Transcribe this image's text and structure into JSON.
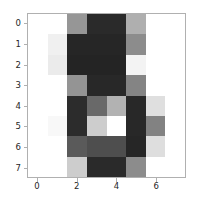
{
  "chart_data": {
    "type": "heatmap",
    "title": "",
    "xlabel": "",
    "ylabel": "",
    "colormap": "gray",
    "grid": false,
    "legend": false,
    "colorbar": false,
    "nrows": 8,
    "ncols": 8,
    "xlim": [
      -0.5,
      7.5
    ],
    "ylim": [
      7.5,
      -0.5
    ],
    "xticks": [
      0,
      2,
      4,
      6
    ],
    "yticks": [
      0,
      1,
      2,
      3,
      4,
      5,
      6,
      7
    ],
    "xtick_labels": [
      "0",
      "2",
      "4",
      "6"
    ],
    "ytick_labels": [
      "0",
      "1",
      "2",
      "3",
      "4",
      "5",
      "6",
      "7"
    ],
    "value_range": [
      0,
      255
    ],
    "note": "Grayscale intensity values; 0 = black, 255 = white",
    "values": [
      [
        255,
        255,
        150,
        42,
        42,
        175,
        255,
        255
      ],
      [
        255,
        240,
        38,
        38,
        38,
        140,
        255,
        255
      ],
      [
        255,
        235,
        36,
        36,
        36,
        243,
        255,
        255
      ],
      [
        255,
        255,
        148,
        40,
        40,
        132,
        255,
        255
      ],
      [
        255,
        255,
        44,
        105,
        178,
        40,
        223,
        255
      ],
      [
        255,
        248,
        44,
        205,
        255,
        40,
        130,
        255
      ],
      [
        255,
        255,
        90,
        78,
        78,
        38,
        222,
        255
      ],
      [
        255,
        255,
        205,
        42,
        42,
        140,
        255,
        255
      ]
    ],
    "colors": [
      [
        "#ffffff",
        "#ffffff",
        "#969696",
        "#2a2a2a",
        "#2a2a2a",
        "#afafaf",
        "#ffffff",
        "#ffffff"
      ],
      [
        "#ffffff",
        "#f0f0f0",
        "#262626",
        "#262626",
        "#262626",
        "#8c8c8c",
        "#ffffff",
        "#ffffff"
      ],
      [
        "#ffffff",
        "#ebebeb",
        "#242424",
        "#242424",
        "#242424",
        "#f3f3f3",
        "#ffffff",
        "#ffffff"
      ],
      [
        "#ffffff",
        "#ffffff",
        "#949494",
        "#282828",
        "#282828",
        "#848484",
        "#ffffff",
        "#ffffff"
      ],
      [
        "#ffffff",
        "#ffffff",
        "#2c2c2c",
        "#696969",
        "#b2b2b2",
        "#282828",
        "#dfdfdf",
        "#ffffff"
      ],
      [
        "#ffffff",
        "#f8f8f8",
        "#2c2c2c",
        "#cdcdcd",
        "#ffffff",
        "#282828",
        "#828282",
        "#ffffff"
      ],
      [
        "#ffffff",
        "#ffffff",
        "#5a5a5a",
        "#4e4e4e",
        "#4e4e4e",
        "#262626",
        "#dedede",
        "#ffffff"
      ],
      [
        "#ffffff",
        "#ffffff",
        "#cdcdcd",
        "#2a2a2a",
        "#2a2a2a",
        "#8c8c8c",
        "#ffffff",
        "#ffffff"
      ]
    ]
  },
  "figure": {
    "background_color": "#ffffff",
    "axes_edge_color": "#b0b0b0",
    "tick_color": "#b0b0b0",
    "tick_label_color": "#262626"
  }
}
